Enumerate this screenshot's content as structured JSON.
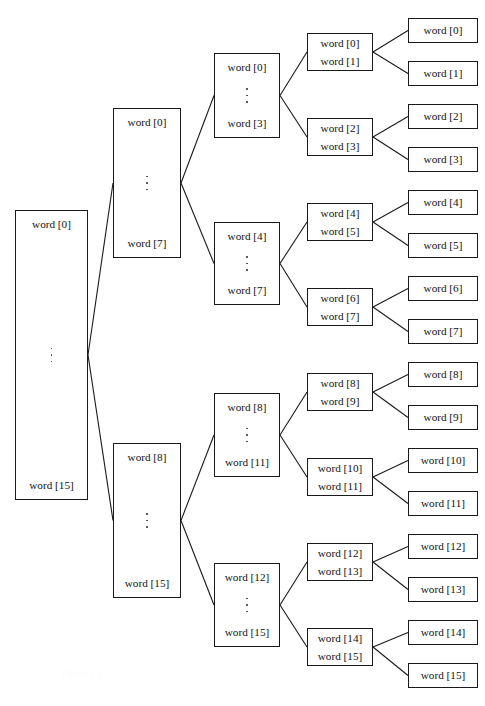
{
  "figure": {
    "caption": "Figure 1.1",
    "background_color": "#ffffff",
    "line_color": "#1a1a1a",
    "text_color": "#111111"
  },
  "levels": [
    {
      "name": "level-0-root",
      "kind": "range",
      "nodes": [
        {
          "id": "n0",
          "first": "word [0]",
          "last": "word [15]",
          "x": 15,
          "y": 210,
          "w": 73,
          "h": 290
        }
      ]
    },
    {
      "name": "level-1-halves",
      "kind": "range",
      "nodes": [
        {
          "id": "n1",
          "first": "word [0]",
          "last": "word [7]",
          "x": 113,
          "y": 108,
          "w": 68,
          "h": 150
        },
        {
          "id": "n2",
          "first": "word [8]",
          "last": "word [15]",
          "x": 113,
          "y": 443,
          "w": 68,
          "h": 155
        }
      ]
    },
    {
      "name": "level-2-quarters",
      "kind": "range",
      "nodes": [
        {
          "id": "n3",
          "first": "word [0]",
          "last": "word [3]",
          "x": 214,
          "y": 53,
          "w": 66,
          "h": 85
        },
        {
          "id": "n4",
          "first": "word [4]",
          "last": "word [7]",
          "x": 214,
          "y": 222,
          "w": 66,
          "h": 83
        },
        {
          "id": "n5",
          "first": "word [8]",
          "last": "word [11]",
          "x": 214,
          "y": 393,
          "w": 66,
          "h": 84
        },
        {
          "id": "n6",
          "first": "word [12]",
          "last": "word [15]",
          "x": 214,
          "y": 563,
          "w": 66,
          "h": 84
        }
      ]
    },
    {
      "name": "level-3-pairs",
      "kind": "pair",
      "nodes": [
        {
          "id": "p0",
          "first": "word [0]",
          "last": "word [1]",
          "x": 307,
          "y": 33,
          "w": 66,
          "h": 38
        },
        {
          "id": "p1",
          "first": "word [2]",
          "last": "word [3]",
          "x": 307,
          "y": 118,
          "w": 66,
          "h": 38
        },
        {
          "id": "p2",
          "first": "word [4]",
          "last": "word [5]",
          "x": 307,
          "y": 203,
          "w": 66,
          "h": 38
        },
        {
          "id": "p3",
          "first": "word [6]",
          "last": "word [7]",
          "x": 307,
          "y": 288,
          "w": 66,
          "h": 38
        },
        {
          "id": "p4",
          "first": "word [8]",
          "last": "word [9]",
          "x": 307,
          "y": 373,
          "w": 66,
          "h": 38
        },
        {
          "id": "p5",
          "first": "word [10]",
          "last": "word [11]",
          "x": 307,
          "y": 458,
          "w": 66,
          "h": 38
        },
        {
          "id": "p6",
          "first": "word [12]",
          "last": "word [13]",
          "x": 307,
          "y": 543,
          "w": 66,
          "h": 38
        },
        {
          "id": "p7",
          "first": "word [14]",
          "last": "word [15]",
          "x": 307,
          "y": 628,
          "w": 66,
          "h": 38
        }
      ]
    },
    {
      "name": "level-4-leaves",
      "kind": "leaf",
      "nodes": [
        {
          "id": "l0",
          "label": "word [0]",
          "x": 408,
          "y": 18,
          "w": 70,
          "h": 25
        },
        {
          "id": "l1",
          "label": "word [1]",
          "x": 408,
          "y": 61,
          "w": 70,
          "h": 25
        },
        {
          "id": "l2",
          "label": "word [2]",
          "x": 408,
          "y": 104,
          "w": 70,
          "h": 25
        },
        {
          "id": "l3",
          "label": "word [3]",
          "x": 408,
          "y": 147,
          "w": 70,
          "h": 25
        },
        {
          "id": "l4",
          "label": "word [4]",
          "x": 408,
          "y": 190,
          "w": 70,
          "h": 25
        },
        {
          "id": "l5",
          "label": "word [5]",
          "x": 408,
          "y": 233,
          "w": 70,
          "h": 25
        },
        {
          "id": "l6",
          "label": "word [6]",
          "x": 408,
          "y": 276,
          "w": 70,
          "h": 25
        },
        {
          "id": "l7",
          "label": "word [7]",
          "x": 408,
          "y": 319,
          "w": 70,
          "h": 25
        },
        {
          "id": "l8",
          "label": "word [8]",
          "x": 408,
          "y": 362,
          "w": 70,
          "h": 25
        },
        {
          "id": "l9",
          "label": "word [9]",
          "x": 408,
          "y": 405,
          "w": 70,
          "h": 25
        },
        {
          "id": "l10",
          "label": "word [10]",
          "x": 408,
          "y": 448,
          "w": 70,
          "h": 25
        },
        {
          "id": "l11",
          "label": "word [11]",
          "x": 408,
          "y": 491,
          "w": 70,
          "h": 25
        },
        {
          "id": "l12",
          "label": "word [12]",
          "x": 408,
          "y": 534,
          "w": 70,
          "h": 25
        },
        {
          "id": "l13",
          "label": "word [13]",
          "x": 408,
          "y": 577,
          "w": 70,
          "h": 25
        },
        {
          "id": "l14",
          "label": "word [14]",
          "x": 408,
          "y": 620,
          "w": 70,
          "h": 25
        },
        {
          "id": "l15",
          "label": "word [15]",
          "x": 408,
          "y": 663,
          "w": 70,
          "h": 25
        }
      ]
    }
  ],
  "edges": [
    {
      "from": "n0",
      "to": "n1"
    },
    {
      "from": "n0",
      "to": "n2"
    },
    {
      "from": "n1",
      "to": "n3"
    },
    {
      "from": "n1",
      "to": "n4"
    },
    {
      "from": "n2",
      "to": "n5"
    },
    {
      "from": "n2",
      "to": "n6"
    },
    {
      "from": "n3",
      "to": "p0"
    },
    {
      "from": "n3",
      "to": "p1"
    },
    {
      "from": "n4",
      "to": "p2"
    },
    {
      "from": "n4",
      "to": "p3"
    },
    {
      "from": "n5",
      "to": "p4"
    },
    {
      "from": "n5",
      "to": "p5"
    },
    {
      "from": "n6",
      "to": "p6"
    },
    {
      "from": "n6",
      "to": "p7"
    },
    {
      "from": "p0",
      "to": "l0"
    },
    {
      "from": "p0",
      "to": "l1"
    },
    {
      "from": "p1",
      "to": "l2"
    },
    {
      "from": "p1",
      "to": "l3"
    },
    {
      "from": "p2",
      "to": "l4"
    },
    {
      "from": "p2",
      "to": "l5"
    },
    {
      "from": "p3",
      "to": "l6"
    },
    {
      "from": "p3",
      "to": "l7"
    },
    {
      "from": "p4",
      "to": "l8"
    },
    {
      "from": "p4",
      "to": "l9"
    },
    {
      "from": "p5",
      "to": "l10"
    },
    {
      "from": "p5",
      "to": "l11"
    },
    {
      "from": "p6",
      "to": "l12"
    },
    {
      "from": "p6",
      "to": "l13"
    },
    {
      "from": "p7",
      "to": "l14"
    },
    {
      "from": "p7",
      "to": "l15"
    }
  ]
}
